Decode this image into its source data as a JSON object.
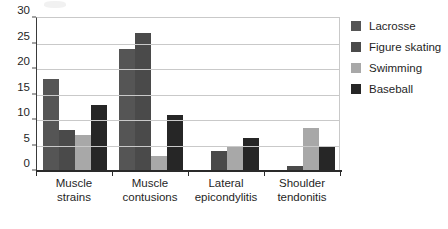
{
  "chart_data": {
    "type": "bar",
    "title": "",
    "xlabel": "",
    "ylabel": "",
    "ylim": [
      0,
      30
    ],
    "y_ticks": [
      0,
      5,
      10,
      15,
      20,
      25,
      30
    ],
    "grid": true,
    "legend_position": "right",
    "categories": [
      "Muscle strains",
      "Muscle contusions",
      "Lateral epicondylitis",
      "Shoulder tendonitis"
    ],
    "category_lines": [
      [
        "Muscle",
        "strains"
      ],
      [
        "Muscle",
        "contusions"
      ],
      [
        "Lateral",
        "epicondylitis"
      ],
      [
        "Shoulder",
        "tendonitis"
      ]
    ],
    "series": [
      {
        "name": "Lacrosse",
        "color": "#555555",
        "values": [
          18,
          24,
          0,
          0
        ]
      },
      {
        "name": "Figure skating",
        "color": "#4a4a4a",
        "values": [
          8,
          27,
          4,
          1
        ]
      },
      {
        "name": "Swimming",
        "color": "#a8a8a8",
        "values": [
          7,
          3,
          5,
          8.5
        ]
      },
      {
        "name": "Baseball",
        "color": "#262626",
        "values": [
          13,
          11,
          6.5,
          5
        ]
      }
    ]
  },
  "legend": {
    "items": [
      {
        "label": "Lacrosse",
        "color": "#555555"
      },
      {
        "label": "Figure skating",
        "color": "#4a4a4a"
      },
      {
        "label": "Swimming",
        "color": "#a8a8a8"
      },
      {
        "label": "Baseball",
        "color": "#262626"
      }
    ]
  }
}
